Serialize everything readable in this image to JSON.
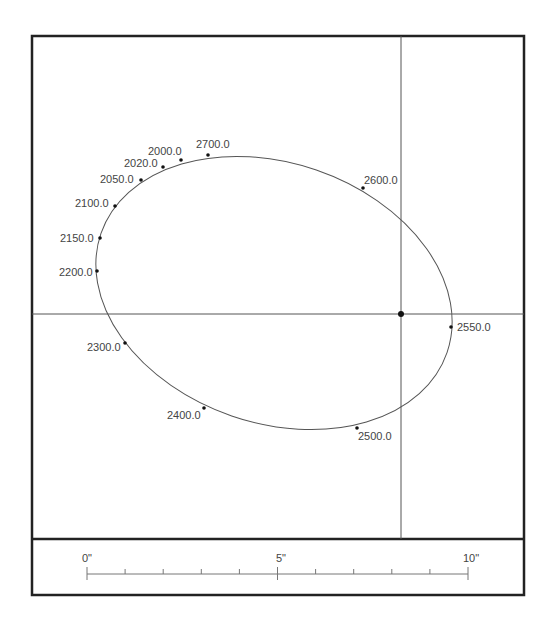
{
  "plot": {
    "frame": {
      "x": 32,
      "y": 36,
      "width": 492,
      "height": 559,
      "divider_y": 539
    },
    "crosshair": {
      "x": 401,
      "y": 314
    },
    "ellipse": {
      "cx": 274,
      "cy": 293,
      "rx": 183,
      "ry": 130,
      "rotation": 19
    },
    "points": [
      {
        "label": "2000.0",
        "x": 181,
        "y": 160,
        "lx": 148,
        "ly": 155
      },
      {
        "label": "2700.0",
        "x": 208,
        "y": 155,
        "lx": 196,
        "ly": 148
      },
      {
        "label": "2020.0",
        "x": 163,
        "y": 167,
        "lx": 124,
        "ly": 167
      },
      {
        "label": "2050.0",
        "x": 141,
        "y": 180,
        "lx": 100,
        "ly": 183
      },
      {
        "label": "2100.0",
        "x": 115,
        "y": 206,
        "lx": 75,
        "ly": 207
      },
      {
        "label": "2150.0",
        "x": 100,
        "y": 238,
        "lx": 60,
        "ly": 242
      },
      {
        "label": "2200.0",
        "x": 97,
        "y": 271,
        "lx": 59,
        "ly": 276
      },
      {
        "label": "2300.0",
        "x": 125,
        "y": 343,
        "lx": 87,
        "ly": 351
      },
      {
        "label": "2400.0",
        "x": 204,
        "y": 408,
        "lx": 167,
        "ly": 419
      },
      {
        "label": "2500.0",
        "x": 357,
        "y": 428,
        "lx": 358,
        "ly": 440
      },
      {
        "label": "2550.0",
        "x": 451,
        "y": 327,
        "lx": 457,
        "ly": 331
      },
      {
        "label": "2600.0",
        "x": 363,
        "y": 188,
        "lx": 364,
        "ly": 184
      }
    ]
  },
  "scale_bar": {
    "labels": [
      {
        "text": "0\"",
        "x": 82
      },
      {
        "text": "5\"",
        "x": 276
      },
      {
        "text": "10\"",
        "x": 463
      }
    ],
    "x_start": 87,
    "x_end": 468,
    "y": 574,
    "ticks": 11
  }
}
